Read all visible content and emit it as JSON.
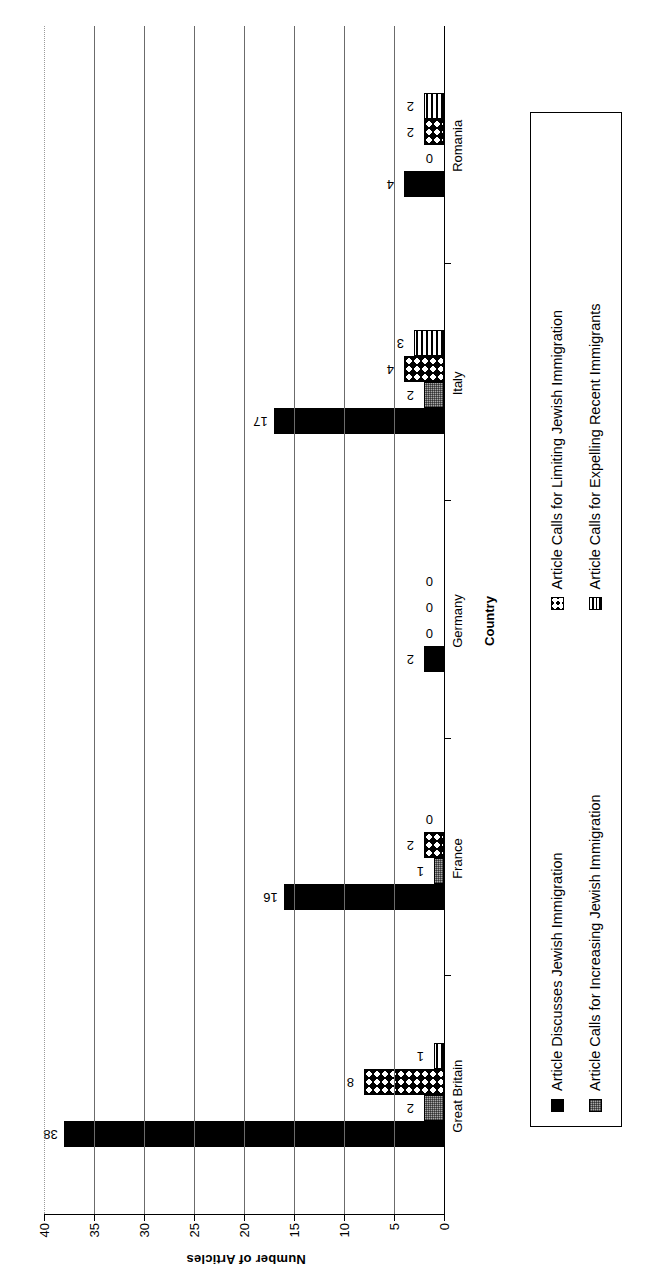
{
  "chart_data": {
    "type": "bar",
    "orientation": "vertical",
    "title": "",
    "xlabel": "Country",
    "ylabel": "Number of Articles",
    "ylim": [
      0,
      40
    ],
    "yticks": [
      0,
      5,
      10,
      15,
      20,
      25,
      30,
      35,
      40
    ],
    "grid": true,
    "legend_position": "bottom",
    "categories": [
      "Great Britain",
      "France",
      "Germany",
      "Italy",
      "Romania"
    ],
    "series": [
      {
        "name": "Article Discusses Jewish Immigration",
        "swatch": "solid-black",
        "color": "#000000",
        "values": [
          38,
          16,
          2,
          17,
          4
        ]
      },
      {
        "name": "Article Calls for Increasing Jewish Immigration",
        "swatch": "gray-stipple",
        "color": "#a8a8a8",
        "values": [
          2,
          1,
          0,
          2,
          0
        ]
      },
      {
        "name": "Article Calls for Limiting Jewish Immigration",
        "swatch": "black-checkered-diamond",
        "color": "#000000",
        "values": [
          8,
          2,
          0,
          4,
          2
        ]
      },
      {
        "name": "Article Calls for Expelling Recent Immigrants",
        "swatch": "horizontal-lines",
        "color": "#000000",
        "values": [
          1,
          0,
          0,
          3,
          2
        ]
      }
    ]
  },
  "axis": {
    "y_title": "Number of Articles",
    "x_title": "Country",
    "y_tick_labels": [
      "0",
      "5",
      "10",
      "15",
      "20",
      "25",
      "30",
      "35",
      "40"
    ],
    "x_tick_labels": [
      "Great Britain",
      "France",
      "Germany",
      "Italy",
      "Romania"
    ]
  },
  "legend": {
    "items": [
      {
        "label": "Article Discusses Jewish Immigration"
      },
      {
        "label": "Article Calls for Increasing Jewish Immigration"
      },
      {
        "label": "Article Calls for Limiting Jewish Immigration"
      },
      {
        "label": "Article Calls for Expelling Recent Immigrants"
      }
    ]
  }
}
